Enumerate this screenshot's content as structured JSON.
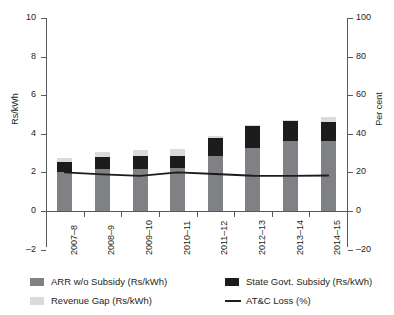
{
  "chart_data": {
    "type": "bar",
    "title": "",
    "subtitle": "",
    "xlabel": "",
    "ylabel": "Rs/kWh",
    "ylabel_secondary": "Per cent",
    "categories": [
      "2007–8",
      "2008–9",
      "2009–10",
      "2010–11",
      "2011–12",
      "2012–13",
      "2013–14",
      "2014–15"
    ],
    "ylim": [
      -2,
      10
    ],
    "yticks": [
      -2,
      0,
      2,
      4,
      6,
      8,
      10
    ],
    "ylim_secondary": [
      -20,
      100
    ],
    "yticks_secondary": [
      -20,
      0,
      20,
      40,
      60,
      80,
      100
    ],
    "grid": false,
    "legend_position": "bottom",
    "stacked": true,
    "series": [
      {
        "name": "ARR w/o Subsidy (Rs/kWh)",
        "type": "bar",
        "color": "#808184",
        "axis": "left",
        "values": [
          2.0,
          2.2,
          2.2,
          2.25,
          2.85,
          3.25,
          3.65,
          3.65
        ]
      },
      {
        "name": "State Govt. Subsidy (Rs/kWh)",
        "type": "bar",
        "color": "#1c1c1c",
        "axis": "left",
        "values": [
          0.55,
          0.6,
          0.65,
          0.6,
          0.95,
          1.15,
          1.0,
          0.95
        ]
      },
      {
        "name": "Revenue Gap (Rs/kWh)",
        "type": "bar",
        "color": "#d9dadb",
        "axis": "left",
        "values": [
          0.2,
          0.25,
          0.3,
          0.35,
          0.1,
          0.05,
          0.05,
          0.25
        ]
      },
      {
        "name": "AT&C Loss (%)",
        "type": "line",
        "color": "#1c1c1c",
        "axis": "right",
        "values": [
          20.0,
          19.0,
          18.2,
          20.0,
          19.2,
          18.3,
          18.2,
          18.4
        ]
      }
    ]
  },
  "axes": {
    "left": {
      "label": "Rs/kWh",
      "ticks": [
        "10",
        "8",
        "6",
        "4",
        "2",
        "0",
        "–2"
      ]
    },
    "right": {
      "label": "Per cent",
      "ticks": [
        "100",
        "80",
        "60",
        "40",
        "20",
        "0",
        "–20"
      ]
    },
    "x": {
      "ticks": [
        "2007–8",
        "2008–9",
        "2009–10",
        "2010–11",
        "2011–12",
        "2012–13",
        "2013–14",
        "2014–15"
      ]
    }
  },
  "legend": {
    "items": [
      {
        "label": "ARR w/o Subsidy (Rs/kWh)",
        "marker": "swatch",
        "color": "#808184"
      },
      {
        "label": "State Govt. Subsidy (Rs/kWh)",
        "marker": "swatch",
        "color": "#1c1c1c"
      },
      {
        "label": "Revenue Gap (Rs/kWh)",
        "marker": "swatch",
        "color": "#d9dadb"
      },
      {
        "label": "AT&C Loss (%)",
        "marker": "line",
        "color": "#1c1c1c"
      }
    ]
  }
}
